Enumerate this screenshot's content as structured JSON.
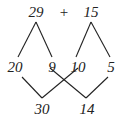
{
  "diagram": {
    "type": "number-bond-decomposition",
    "top_row": {
      "left_number": "29",
      "operator": "+",
      "right_number": "15"
    },
    "middle_row": {
      "left_split": [
        "20",
        "9"
      ],
      "right_split": [
        "10",
        "5"
      ]
    },
    "bottom_row": {
      "left_sum": "30",
      "right_sum": "14"
    },
    "connections": [
      {
        "from": "29",
        "to": "20"
      },
      {
        "from": "29",
        "to": "9"
      },
      {
        "from": "15",
        "to": "10"
      },
      {
        "from": "15",
        "to": "5"
      },
      {
        "from": "20",
        "to": "30"
      },
      {
        "from": "10",
        "to": "30"
      },
      {
        "from": "9",
        "to": "14"
      },
      {
        "from": "5",
        "to": "14"
      }
    ],
    "colors": {
      "ink": "#222222",
      "background": "#ffffff"
    }
  }
}
